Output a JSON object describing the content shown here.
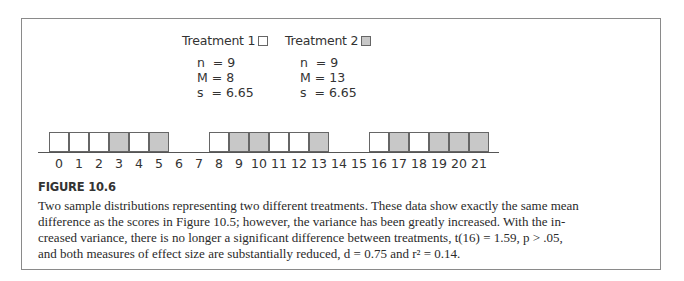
{
  "legend": {
    "treatment1": {
      "label": "Treatment 1",
      "swatch_color": "#ffffff"
    },
    "treatment2": {
      "label": "Treatment 2",
      "swatch_color": "#c8c8c8"
    }
  },
  "stats": {
    "treatment1": {
      "n": "n  = 9",
      "M": "M = 8",
      "s": "s  = 6.65"
    },
    "treatment2": {
      "n": "n  = 9",
      "M": "M = 13",
      "s": "s  = 6.65"
    }
  },
  "chart_data": {
    "type": "bar",
    "title": "",
    "xlabel": "",
    "ylabel": "",
    "categories": [
      "0",
      "1",
      "2",
      "3",
      "4",
      "5",
      "6",
      "7",
      "8",
      "9",
      "10",
      "11",
      "12",
      "13",
      "14",
      "15",
      "16",
      "17",
      "18",
      "19",
      "20",
      "21"
    ],
    "series": [
      {
        "name": "Treatment 1",
        "color": "#ffffff",
        "scores": [
          0,
          1,
          2,
          4,
          8,
          11,
          12,
          16,
          18
        ],
        "values": [
          1,
          1,
          1,
          0,
          1,
          0,
          0,
          0,
          1,
          0,
          0,
          1,
          1,
          0,
          0,
          0,
          1,
          0,
          1,
          0,
          0,
          0
        ]
      },
      {
        "name": "Treatment 2",
        "color": "#c8c8c8",
        "scores": [
          3,
          5,
          9,
          10,
          13,
          17,
          19,
          20,
          21
        ],
        "values": [
          0,
          0,
          0,
          1,
          0,
          1,
          0,
          0,
          0,
          1,
          1,
          0,
          0,
          1,
          0,
          0,
          0,
          1,
          0,
          1,
          1,
          1
        ]
      }
    ],
    "ylim": [
      0,
      1
    ],
    "grid": false,
    "legend_position": "top"
  },
  "figure": {
    "label": "FIGURE 10.6",
    "caption_lines": [
      "Two sample distributions representing two different treatments. These data show exactly the same mean",
      "difference as the scores in Figure 10.5; however, the variance has been greatly increased. With the in-",
      "creased variance, there is no longer a significant difference between treatments, t(16) = 1.59, p > .05,",
      "and both measures of effect size are substantially reduced, d = 0.75 and r² = 0.14."
    ]
  }
}
